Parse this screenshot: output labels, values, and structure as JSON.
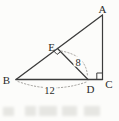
{
  "figure": {
    "labels": {
      "A": "A",
      "B": "B",
      "C": "C",
      "D": "D",
      "E": "E"
    },
    "measurements": {
      "ED": "8",
      "BD": "12"
    }
  },
  "colors": {
    "line": "#3c3c3c",
    "dashed": "#95938f",
    "label": "#2b2b2b",
    "background": "#fcfcfa",
    "artifact": "#e6e6e2"
  }
}
